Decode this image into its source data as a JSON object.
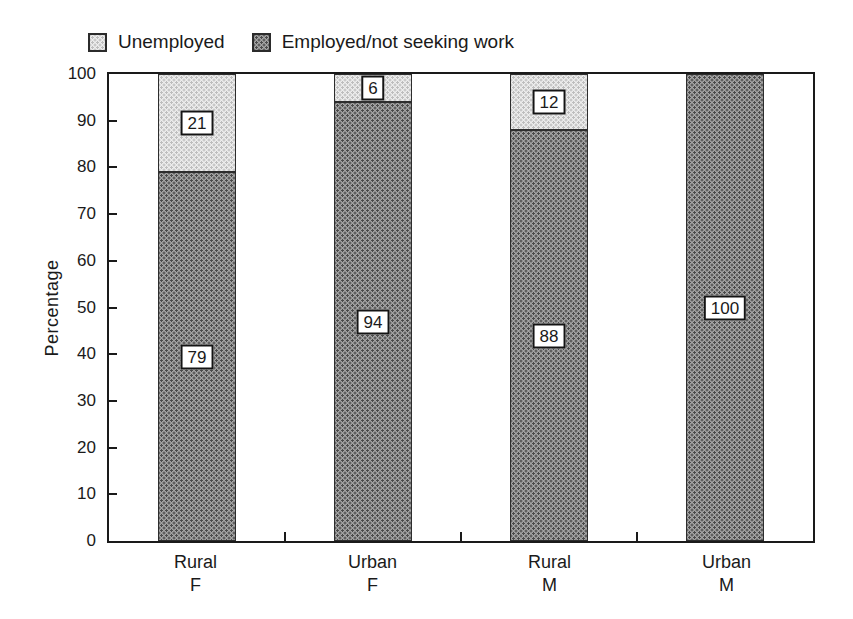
{
  "figure": {
    "background": "#ffffff",
    "ink": "#1a1a1a"
  },
  "legend": {
    "position": "top",
    "items": [
      {
        "label": "Unemployed",
        "swatch": "light-stipple"
      },
      {
        "label": "Employed/not seeking work",
        "swatch": "dark-stipple"
      }
    ]
  },
  "chart_data": {
    "type": "bar",
    "stacked": true,
    "title": "",
    "xlabel": "",
    "ylabel": "Percentage",
    "ylim": [
      0,
      100
    ],
    "yticks": [
      0,
      10,
      20,
      30,
      40,
      50,
      60,
      70,
      80,
      90,
      100
    ],
    "grid": false,
    "legend_position": "top",
    "bar_value_labels": true,
    "categories": [
      [
        "Rural",
        "F"
      ],
      [
        "Urban",
        "F"
      ],
      [
        "Rural",
        "M"
      ],
      [
        "Urban",
        "M"
      ]
    ],
    "series": [
      {
        "name": "Employed/not seeking work",
        "swatch": "dark-stipple",
        "values": [
          79,
          94,
          88,
          100
        ]
      },
      {
        "name": "Unemployed",
        "swatch": "light-stipple",
        "values": [
          21,
          6,
          12,
          0
        ]
      }
    ]
  },
  "colors": {
    "dark_fill": "#a4a4a4",
    "dark_dot": "#4a4a4a",
    "light_fill": "#ededed",
    "light_dot": "#bdbdbd",
    "ink": "#1a1a1a"
  }
}
